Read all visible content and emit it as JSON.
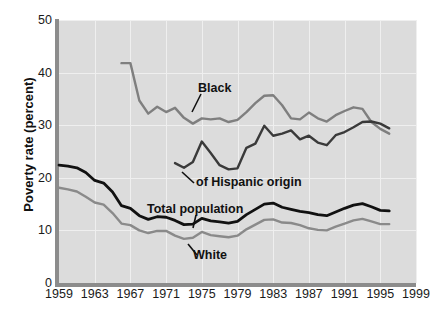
{
  "chart_data": {
    "type": "line",
    "title": "",
    "xlabel": "",
    "ylabel": "Poverty rate (percent)",
    "xlim": [
      1959,
      1999
    ],
    "ylim": [
      0,
      50
    ],
    "grid": true,
    "legend_position": "inline-labels",
    "yticks": [
      0,
      10,
      20,
      30,
      40,
      50
    ],
    "xticks": [
      1959,
      1963,
      1967,
      1971,
      1975,
      1979,
      1983,
      1987,
      1991,
      1995,
      1999
    ],
    "colors": {
      "black_series": "#7f7f7f",
      "white_series": "#8a8a8a",
      "total_population": "#111111",
      "hispanic_origin": "#3a3a3a",
      "plot_background": "#dcdcdc",
      "gridline": "#efefef",
      "axis": "#8c8c8c"
    },
    "series": [
      {
        "name": "Black",
        "color": "#7f7f7f",
        "x": [
          1966,
          1967,
          1968,
          1969,
          1970,
          1971,
          1972,
          1973,
          1974,
          1975,
          1976,
          1977,
          1978,
          1979,
          1980,
          1981,
          1982,
          1983,
          1984,
          1985,
          1986,
          1987,
          1988,
          1989,
          1990,
          1991,
          1992,
          1993,
          1994,
          1995,
          1996
        ],
        "values": [
          41.8,
          41.8,
          34.7,
          32.2,
          33.5,
          32.5,
          33.3,
          31.4,
          30.3,
          31.3,
          31.1,
          31.3,
          30.6,
          31.0,
          32.5,
          34.2,
          35.6,
          35.7,
          33.8,
          31.3,
          31.1,
          32.4,
          31.3,
          30.7,
          31.9,
          32.7,
          33.4,
          33.1,
          30.6,
          29.3,
          28.4
        ]
      },
      {
        "name": "of Hispanic origin",
        "color": "#3a3a3a",
        "x": [
          1972,
          1973,
          1974,
          1975,
          1976,
          1977,
          1978,
          1979,
          1980,
          1981,
          1982,
          1983,
          1984,
          1985,
          1986,
          1987,
          1988,
          1989,
          1990,
          1991,
          1992,
          1993,
          1994,
          1995,
          1996
        ],
        "values": [
          22.8,
          21.9,
          23.0,
          26.9,
          24.7,
          22.4,
          21.6,
          21.8,
          25.7,
          26.5,
          29.9,
          28.0,
          28.4,
          29.0,
          27.3,
          28.0,
          26.7,
          26.2,
          28.1,
          28.7,
          29.6,
          30.6,
          30.7,
          30.3,
          29.4
        ]
      },
      {
        "name": "Total population",
        "color": "#111111",
        "x": [
          1959,
          1960,
          1961,
          1962,
          1963,
          1964,
          1965,
          1966,
          1967,
          1968,
          1969,
          1970,
          1971,
          1972,
          1973,
          1974,
          1975,
          1976,
          1977,
          1978,
          1979,
          1980,
          1981,
          1982,
          1983,
          1984,
          1985,
          1986,
          1987,
          1988,
          1989,
          1990,
          1991,
          1992,
          1993,
          1994,
          1995,
          1996
        ],
        "values": [
          22.4,
          22.2,
          21.9,
          21.0,
          19.5,
          19.0,
          17.3,
          14.7,
          14.2,
          12.8,
          12.1,
          12.6,
          12.5,
          11.9,
          11.1,
          11.2,
          12.3,
          11.8,
          11.6,
          11.4,
          11.7,
          13.0,
          14.0,
          15.0,
          15.2,
          14.4,
          14.0,
          13.6,
          13.4,
          13.0,
          12.8,
          13.5,
          14.2,
          14.8,
          15.1,
          14.5,
          13.8,
          13.7
        ]
      },
      {
        "name": "White",
        "color": "#8a8a8a",
        "x": [
          1959,
          1960,
          1961,
          1962,
          1963,
          1964,
          1965,
          1966,
          1967,
          1968,
          1969,
          1970,
          1971,
          1972,
          1973,
          1974,
          1975,
          1976,
          1977,
          1978,
          1979,
          1980,
          1981,
          1982,
          1983,
          1984,
          1985,
          1986,
          1987,
          1988,
          1989,
          1990,
          1991,
          1992,
          1993,
          1994,
          1995,
          1996
        ],
        "values": [
          18.1,
          17.8,
          17.4,
          16.4,
          15.3,
          14.9,
          13.3,
          11.3,
          11.0,
          10.0,
          9.5,
          9.9,
          9.9,
          9.0,
          8.4,
          8.6,
          9.7,
          9.1,
          8.9,
          8.7,
          9.0,
          10.2,
          11.1,
          12.0,
          12.1,
          11.5,
          11.4,
          11.0,
          10.4,
          10.1,
          10.0,
          10.7,
          11.3,
          11.9,
          12.2,
          11.7,
          11.2,
          11.2
        ]
      }
    ],
    "annotations": [
      {
        "label": "Black",
        "target_x": 1980,
        "target_y": 32.0
      },
      {
        "label": "of Hispanic origin",
        "target_x": 1973,
        "target_y": 22.0
      },
      {
        "label": "Total population",
        "target_x": 1985,
        "target_y": 14.0
      },
      {
        "label": "White",
        "target_x": 1980,
        "target_y": 10.4
      }
    ]
  }
}
